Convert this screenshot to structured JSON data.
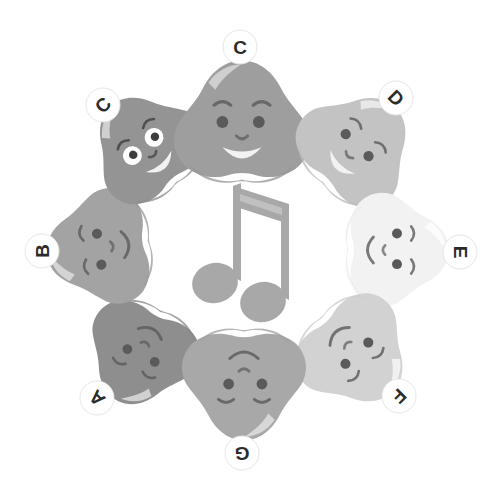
{
  "illustration": {
    "title": "Seven smiling note-heads arranged in a ring around a musical note",
    "background_color": "#ffffff",
    "center_icon": {
      "name": "beamed-eighth-notes",
      "label": "beamed eighth notes",
      "color": "#a8a8a8",
      "highlight_color": "#c4c4c4"
    },
    "ring": {
      "center_x": 248,
      "center_y": 247,
      "radius": 142,
      "count": 7
    },
    "faces": [
      {
        "id": "face-a",
        "label": "A",
        "label_angle": 225,
        "badge_x": 97,
        "badge_y": 398,
        "cx": 140,
        "cy": 355,
        "rotation": 205,
        "fill": "#8e8e8e",
        "shade": "#858585",
        "highlight": "#d8d8d8",
        "eye_style": "dot",
        "eye_color": "#5a5a5a",
        "mouth": "smile",
        "size": 116
      },
      {
        "id": "face-b",
        "label": "B",
        "label_angle": 270,
        "badge_x": 42,
        "badge_y": 251,
        "cx": 99,
        "cy": 248,
        "rotation": 262,
        "fill": "#a3a3a3",
        "shade": "#9a9a9a",
        "highlight": "#d9d9d9",
        "eye_style": "dot",
        "eye_color": "#5a5a5a",
        "mouth": "smile",
        "size": 120
      },
      {
        "id": "face-c-left",
        "label": "C",
        "label_angle": 315,
        "badge_x": 103,
        "badge_y": 105,
        "cx": 145,
        "cy": 145,
        "rotation": 320,
        "fill": "#949494",
        "shade": "#8b8b8b",
        "highlight": "#d6d6d6",
        "eye_style": "white",
        "eye_color": "#3d3d3d",
        "mouth": "open-smile",
        "size": 118
      },
      {
        "id": "face-c-top",
        "label": "C",
        "label_angle": 0,
        "badge_x": 240,
        "badge_y": 47,
        "cx": 242,
        "cy": 122,
        "rotation": 0,
        "fill": "#9e9e9e",
        "shade": "#959595",
        "highlight": "#d4d4d4",
        "eye_style": "dot",
        "eye_color": "#5a5a5a",
        "mouth": "open-smile",
        "size": 140
      },
      {
        "id": "face-d",
        "label": "D",
        "label_angle": 45,
        "badge_x": 396,
        "badge_y": 98,
        "cx": 358,
        "cy": 146,
        "rotation": 44,
        "fill": "#c3c3c3",
        "shade": "#bababa",
        "highlight": "#ececec",
        "eye_style": "dot",
        "eye_color": "#5a5a5a",
        "mouth": "open-smile",
        "size": 122
      },
      {
        "id": "face-e",
        "label": "E",
        "label_angle": 90,
        "badge_x": 460,
        "badge_y": 252,
        "cx": 397,
        "cy": 250,
        "rotation": 90,
        "fill": "#f2f2f2",
        "shade": "#ebebeb",
        "highlight": "#fdfdfd",
        "eye_style": "dot",
        "eye_color": "#5a5a5a",
        "mouth": "smile",
        "size": 118
      },
      {
        "id": "face-f",
        "label": "F",
        "label_angle": 135,
        "badge_x": 399,
        "badge_y": 396,
        "cx": 356,
        "cy": 354,
        "rotation": 137,
        "fill": "#d2d2d2",
        "shade": "#c9c9c9",
        "highlight": "#f3f3f3",
        "eye_style": "dot",
        "eye_color": "#5a5a5a",
        "mouth": "smile",
        "size": 120
      },
      {
        "id": "face-g",
        "label": "G",
        "label_angle": 180,
        "badge_x": 242,
        "badge_y": 453,
        "cx": 244,
        "cy": 384,
        "rotation": 180,
        "fill": "#a8a8a8",
        "shade": "#9f9f9f",
        "highlight": "#dcdcdc",
        "eye_style": "dot",
        "eye_color": "#5a5a5a",
        "mouth": "smile",
        "size": 128
      }
    ],
    "badge": {
      "fill": "#ffffff",
      "text_color": "#2b2b2b",
      "radius": 17,
      "stroke": "#e6e6e6"
    }
  }
}
